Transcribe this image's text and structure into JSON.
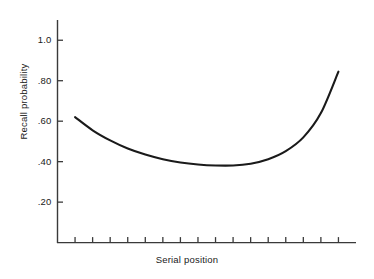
{
  "chart_data": {
    "type": "line",
    "title": "",
    "xlabel": "Serial position",
    "ylabel": "Recall probability",
    "xlim": [
      0,
      17
    ],
    "ylim": [
      0,
      1.1
    ],
    "grid": false,
    "legend": null,
    "y_ticks": [
      {
        "value": 1.0,
        "label": "1.0"
      },
      {
        "value": 0.8,
        "label": ".80"
      },
      {
        "value": 0.6,
        "label": ".60"
      },
      {
        "value": 0.4,
        "label": ".40"
      },
      {
        "value": 0.2,
        "label": ".20"
      }
    ],
    "x_tick_count": 16,
    "x_tick_labels": [],
    "series": [
      {
        "name": "Recall probability",
        "x": [
          1,
          2,
          3,
          4,
          5,
          6,
          7,
          8,
          9,
          10,
          11,
          12,
          13,
          14,
          15,
          16
        ],
        "values": [
          0.62,
          0.555,
          0.505,
          0.465,
          0.435,
          0.412,
          0.396,
          0.386,
          0.381,
          0.381,
          0.39,
          0.412,
          0.452,
          0.52,
          0.64,
          0.845
        ],
        "color": "#1a1a1a"
      }
    ],
    "annotations": []
  },
  "axes": {
    "y_axis_name": "y-axis",
    "x_axis_name": "x-axis"
  }
}
